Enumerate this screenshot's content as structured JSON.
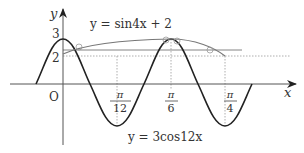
{
  "diagram": {
    "type": "function-graph",
    "axes": {
      "x_label": "x",
      "y_label": "y",
      "origin_label": "O"
    },
    "y_ticks": [
      {
        "label": "3",
        "value": 3
      },
      {
        "label": "2",
        "value": 2
      }
    ],
    "x_ticks": [
      {
        "numerator": "π",
        "denominator": "12",
        "value": "pi/12"
      },
      {
        "numerator": "π",
        "denominator": "6",
        "value": "pi/6"
      },
      {
        "numerator": "π",
        "denominator": "4",
        "value": "pi/4"
      }
    ],
    "curves": [
      {
        "name": "cosine-curve",
        "label": "y = 3cos12x",
        "color": "#222222"
      },
      {
        "name": "sine-curve",
        "label": "y = sin4x + 2",
        "color": "#777777"
      }
    ],
    "colors": {
      "axis": "#555555",
      "dotted": "#888888",
      "text": "#333333"
    }
  }
}
